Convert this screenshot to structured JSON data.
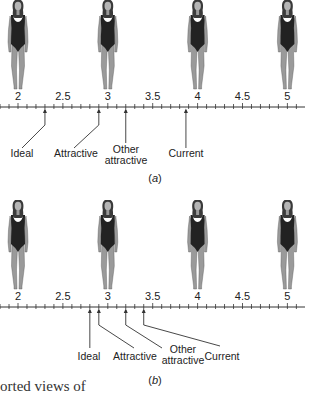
{
  "figure": {
    "scale": {
      "min": 1.95,
      "max": 5.15,
      "tick_step": 0.1,
      "labels": [
        "2",
        "2.5",
        "3",
        "3.5",
        "4",
        "4.5",
        "5"
      ],
      "label_values": [
        2,
        2.5,
        3,
        3.5,
        4,
        4.5,
        5
      ],
      "figure_positions": [
        2,
        3,
        4,
        5
      ]
    },
    "panels": [
      {
        "id": "a",
        "label": "(a)",
        "markers": [
          {
            "name": "Ideal",
            "lines": [
              "Ideal"
            ],
            "value": 2.3
          },
          {
            "name": "Attractive",
            "lines": [
              "Attractive"
            ],
            "value": 2.9
          },
          {
            "name": "Other attractive",
            "lines": [
              "Other",
              "attractive"
            ],
            "value": 3.2
          },
          {
            "name": "Current",
            "lines": [
              "Current"
            ],
            "value": 3.87
          }
        ]
      },
      {
        "id": "b",
        "label": "(b)",
        "markers": [
          {
            "name": "Ideal",
            "lines": [
              "Ideal"
            ],
            "value": 2.8
          },
          {
            "name": "Attractive",
            "lines": [
              "Attractive"
            ],
            "value": 2.9
          },
          {
            "name": "Other attractive",
            "lines": [
              "Other",
              "attractive"
            ],
            "value": 3.2
          },
          {
            "name": "Current",
            "lines": [
              "Current"
            ],
            "value": 3.4
          }
        ]
      }
    ],
    "caption_fragment": "orted views of"
  },
  "colors": {
    "line": "#333333",
    "suit": "#222222",
    "skin": "#9a9a9a",
    "hair": "#3a3a3a"
  }
}
